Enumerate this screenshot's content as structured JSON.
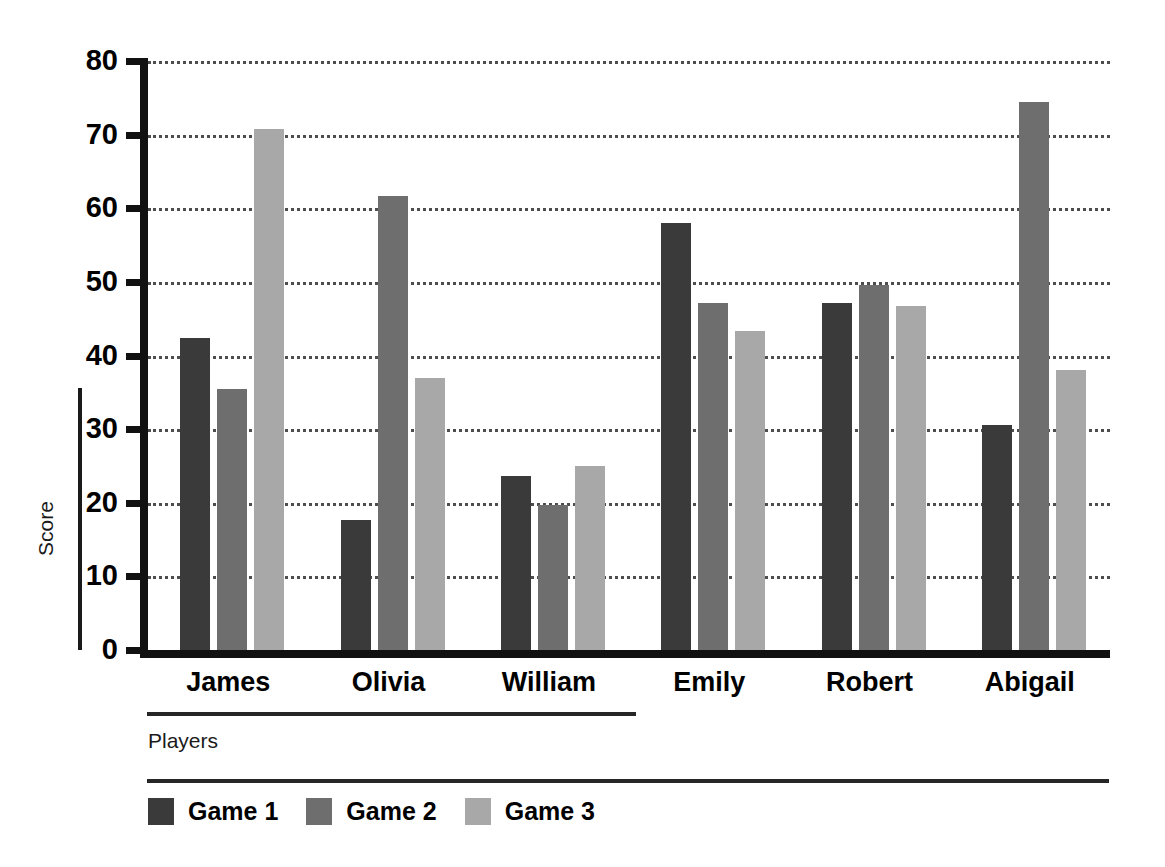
{
  "chart_data": {
    "type": "bar",
    "title": "",
    "xlabel": "Players",
    "ylabel": "Score",
    "categories": [
      "James",
      "Olivia",
      "William",
      "Emily",
      "Robert",
      "Abigail"
    ],
    "series": [
      {
        "name": "Game 1",
        "color": "#3a3a3a",
        "values": [
          42.4,
          17.7,
          23.7,
          58.0,
          47.1,
          30.6
        ]
      },
      {
        "name": "Game 2",
        "color": "#6e6e6e",
        "values": [
          35.5,
          61.6,
          19.7,
          47.1,
          49.6,
          74.4
        ]
      },
      {
        "name": "Game 3",
        "color": "#a8a8a8",
        "values": [
          70.8,
          37.0,
          25.0,
          43.3,
          46.7,
          38.0
        ]
      }
    ],
    "ylim": [
      0,
      80
    ],
    "yticks": [
      0,
      10,
      20,
      30,
      40,
      50,
      60,
      70,
      80
    ],
    "ytick_labels": [
      "0",
      "10",
      "20",
      "30",
      "40",
      "50",
      "60",
      "70",
      "80"
    ],
    "grid": true,
    "grid_style": "dotted",
    "legend_position": "bottom-left"
  },
  "legend": {
    "items": [
      {
        "label": "Game 1",
        "color": "#3a3a3a"
      },
      {
        "label": "Game 2",
        "color": "#6e6e6e"
      },
      {
        "label": "Game 3",
        "color": "#a8a8a8"
      }
    ]
  },
  "axes": {
    "y_title": "Score",
    "x_title": "Players"
  }
}
